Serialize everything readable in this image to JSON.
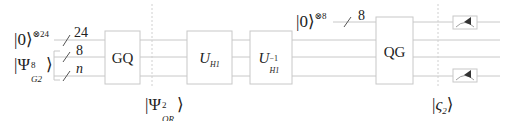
{
  "diagram": {
    "type": "quantum-circuit",
    "colors": {
      "wire": "#c8c8c8",
      "box": "#c8c8c8",
      "text": "#222222",
      "meter": "#333333"
    },
    "inputs": [
      {
        "ket": "0",
        "exponent": "⊗24",
        "bus_width": "24"
      },
      {
        "ket": "Ψ",
        "superscript": "8",
        "subscript": "G2",
        "bus_widths": [
          "8",
          "n"
        ]
      }
    ],
    "ancilla": {
      "ket": "0",
      "exponent": "⊗8",
      "bus_width": "8"
    },
    "gates": [
      {
        "id": "gq",
        "label": "GQ"
      },
      {
        "id": "uh1",
        "label": "U",
        "subscript": "H1"
      },
      {
        "id": "uh1-inv",
        "label": "U",
        "superscript": "−1",
        "subscript": "H1"
      },
      {
        "id": "qg",
        "label": "QG"
      }
    ],
    "state_markers": [
      {
        "id": "psi-qr",
        "ket": "Ψ",
        "superscript": "2",
        "subscript": "QR"
      },
      {
        "id": "varsigma-2",
        "ket": "ς",
        "subscript": "2"
      }
    ],
    "measurements": [
      {
        "wire": "ancilla"
      },
      {
        "wire": "n-register"
      }
    ]
  }
}
